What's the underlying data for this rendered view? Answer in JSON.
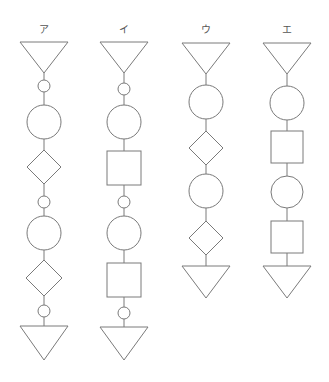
{
  "diagram": {
    "stroke_color": "#7a7a7a",
    "columns": [
      {
        "label": "ア",
        "x": 44,
        "shapes": [
          {
            "type": "triangle-down",
            "top": 42,
            "bottom": 73,
            "half_width": 24
          },
          {
            "type": "small-circle",
            "cy": 86,
            "r": 6
          },
          {
            "type": "large-circle",
            "cy": 122,
            "r": 17
          },
          {
            "type": "diamond",
            "cy": 167,
            "half": 17
          },
          {
            "type": "small-circle",
            "cy": 202,
            "r": 6
          },
          {
            "type": "large-circle",
            "cy": 233,
            "r": 17
          },
          {
            "type": "diamond",
            "cy": 278,
            "half": 18
          },
          {
            "type": "small-circle",
            "cy": 311,
            "r": 6
          },
          {
            "type": "triangle-down",
            "top": 326,
            "bottom": 360,
            "half_width": 24
          }
        ]
      },
      {
        "label": "イ",
        "x": 124,
        "shapes": [
          {
            "type": "triangle-down",
            "top": 42,
            "bottom": 73,
            "half_width": 24
          },
          {
            "type": "small-circle",
            "cy": 89,
            "r": 6
          },
          {
            "type": "large-circle",
            "cy": 122,
            "r": 17
          },
          {
            "type": "square",
            "cy": 168,
            "half": 17
          },
          {
            "type": "small-circle",
            "cy": 202,
            "r": 6
          },
          {
            "type": "large-circle",
            "cy": 233,
            "r": 17
          },
          {
            "type": "square",
            "cy": 280,
            "half": 17
          },
          {
            "type": "small-circle",
            "cy": 313,
            "r": 6
          },
          {
            "type": "triangle-down",
            "top": 327,
            "bottom": 360,
            "half_width": 24
          }
        ]
      },
      {
        "label": "ウ",
        "x": 206,
        "shapes": [
          {
            "type": "triangle-down",
            "top": 43,
            "bottom": 74,
            "half_width": 24
          },
          {
            "type": "large-circle",
            "cy": 102,
            "r": 17
          },
          {
            "type": "diamond",
            "cy": 148,
            "half": 17
          },
          {
            "type": "large-circle",
            "cy": 191,
            "r": 17
          },
          {
            "type": "diamond",
            "cy": 238,
            "half": 17
          },
          {
            "type": "triangle-down",
            "top": 266,
            "bottom": 298,
            "half_width": 24
          }
        ]
      },
      {
        "label": "エ",
        "x": 287,
        "shapes": [
          {
            "type": "triangle-down",
            "top": 43,
            "bottom": 74,
            "half_width": 24
          },
          {
            "type": "large-circle",
            "cy": 103,
            "r": 17
          },
          {
            "type": "square",
            "cy": 147,
            "half": 16
          },
          {
            "type": "large-circle",
            "cy": 192,
            "r": 16
          },
          {
            "type": "square",
            "cy": 237,
            "half": 16
          },
          {
            "type": "triangle-down",
            "top": 266,
            "bottom": 298,
            "half_width": 24
          }
        ]
      }
    ]
  }
}
